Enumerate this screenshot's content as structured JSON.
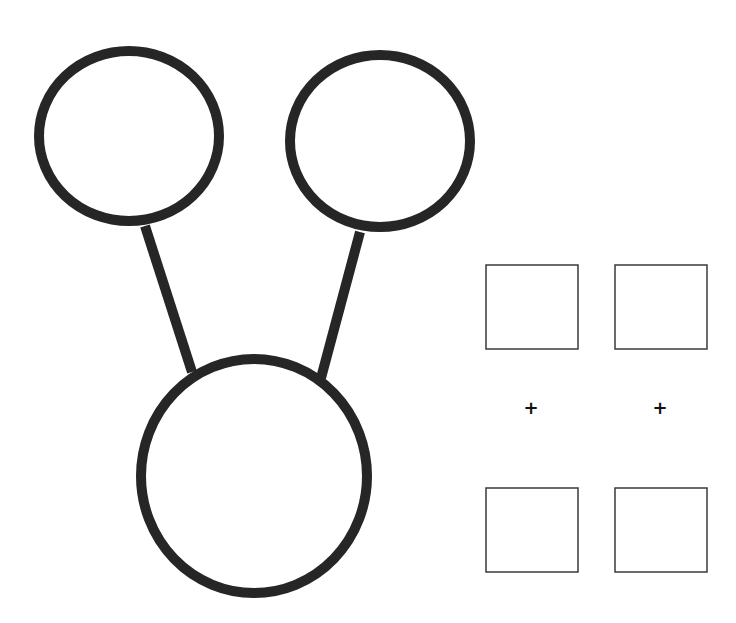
{
  "diagram": {
    "colors": {
      "stroke": "#262626",
      "box_stroke": "#3a3a3a",
      "background": "#ffffff"
    },
    "tree": {
      "nodes": [
        {
          "id": "top-left",
          "cx": 129,
          "cy": 136,
          "rx": 90,
          "ry": 85
        },
        {
          "id": "top-right",
          "cx": 380,
          "cy": 141,
          "rx": 90,
          "ry": 86
        },
        {
          "id": "bottom",
          "cx": 254,
          "cy": 476,
          "rx": 113,
          "ry": 117
        }
      ],
      "edges": [
        {
          "from": "top-left",
          "to": "bottom",
          "x1": 145,
          "y1": 226,
          "x2": 192,
          "y2": 372
        },
        {
          "from": "top-right",
          "to": "bottom",
          "x1": 360,
          "y1": 232,
          "x2": 321,
          "y2": 378
        }
      ]
    },
    "grid": {
      "boxes": [
        {
          "id": "box-top-left",
          "x": 486,
          "y": 265,
          "w": 92,
          "h": 84
        },
        {
          "id": "box-top-right",
          "x": 615,
          "y": 265,
          "w": 92,
          "h": 84
        },
        {
          "id": "box-bottom-left",
          "x": 486,
          "y": 488,
          "w": 92,
          "h": 84
        },
        {
          "id": "box-bottom-right",
          "x": 615,
          "y": 488,
          "w": 92,
          "h": 84
        }
      ],
      "plus_marks": [
        {
          "id": "plus-left",
          "x": 531,
          "y": 408,
          "glyph": "+"
        },
        {
          "id": "plus-right",
          "x": 660,
          "y": 408,
          "glyph": "+"
        }
      ]
    }
  }
}
